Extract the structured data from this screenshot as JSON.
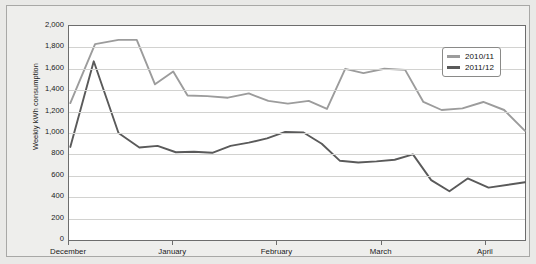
{
  "chart_data": {
    "type": "line",
    "title": "",
    "xlabel": "",
    "ylabel": "Weekly kWh consumption",
    "ylim": [
      0,
      2000
    ],
    "ytick_labels": [
      "2,000",
      "1,800",
      "1,600",
      "1,400",
      "1,200",
      "1,000",
      "800",
      "600",
      "400",
      "200",
      "0"
    ],
    "ytick_values": [
      2000,
      1800,
      1600,
      1400,
      1200,
      1000,
      800,
      600,
      400,
      200,
      0
    ],
    "categories": [
      "December",
      "January",
      "February",
      "March",
      "April"
    ],
    "xtick_values": [
      0,
      4,
      8,
      12,
      16
    ],
    "grid": true,
    "legend_position": "top-right",
    "series": [
      {
        "name": "2010/11",
        "color": "#9c9c9c",
        "x": [
          0.05,
          1.0,
          1.9,
          2.6,
          3.3,
          4.0,
          4.55,
          5.3,
          6.1,
          6.9,
          7.65,
          8.4,
          9.2,
          9.9,
          10.6,
          11.3,
          12.1,
          12.9,
          13.6,
          14.3,
          15.1,
          15.9,
          16.7,
          17.5
        ],
        "values": [
          1280,
          1830,
          1870,
          1870,
          1455,
          1575,
          1350,
          1345,
          1330,
          1370,
          1300,
          1275,
          1300,
          1225,
          1600,
          1560,
          1600,
          1590,
          1290,
          1215,
          1230,
          1290,
          1215,
          1020
        ]
      },
      {
        "name": "2011/12",
        "color": "#5a5a5a",
        "x": [
          0.05,
          0.95,
          1.9,
          2.7,
          3.4,
          4.1,
          4.8,
          5.5,
          6.2,
          6.9,
          7.6,
          8.3,
          9.0,
          9.7,
          10.4,
          11.1,
          11.8,
          12.5,
          13.2,
          13.9,
          14.6,
          15.3,
          16.1,
          17.5
        ],
        "values": [
          870,
          1670,
          1000,
          865,
          880,
          820,
          825,
          815,
          880,
          910,
          950,
          1010,
          1005,
          900,
          740,
          725,
          735,
          750,
          800,
          560,
          455,
          575,
          490,
          540
        ]
      }
    ]
  },
  "legend": {
    "items": [
      {
        "label": "2010/11"
      },
      {
        "label": "2011/12"
      }
    ]
  }
}
